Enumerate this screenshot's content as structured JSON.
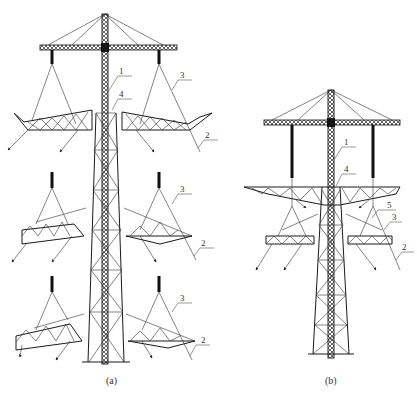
{
  "figure": {
    "panels": [
      {
        "id": "a",
        "caption": "(a)",
        "labels": [
          {
            "text": "1",
            "part": "lifting-mast"
          },
          {
            "text": "4",
            "part": "tower-body-top"
          },
          {
            "text": "3",
            "part": "hoist-rope-upper"
          },
          {
            "text": "2",
            "part": "control-rope-upper"
          },
          {
            "text": "3",
            "part": "hoist-rope-middle"
          },
          {
            "text": "2",
            "part": "control-rope-middle"
          },
          {
            "text": "3",
            "part": "hoist-rope-lower"
          },
          {
            "text": "2",
            "part": "control-rope-lower"
          }
        ]
      },
      {
        "id": "b",
        "caption": "(b)",
        "labels": [
          {
            "text": "1",
            "part": "lifting-mast"
          },
          {
            "text": "4",
            "part": "tower-body-top"
          },
          {
            "text": "5",
            "part": "upper-crossarm"
          },
          {
            "text": "3",
            "part": "hoist-rope"
          },
          {
            "text": "2",
            "part": "control-rope"
          }
        ]
      }
    ]
  },
  "colors": {
    "line": "#1a1a1a",
    "leader": "#555555",
    "background": "#ffffff"
  }
}
